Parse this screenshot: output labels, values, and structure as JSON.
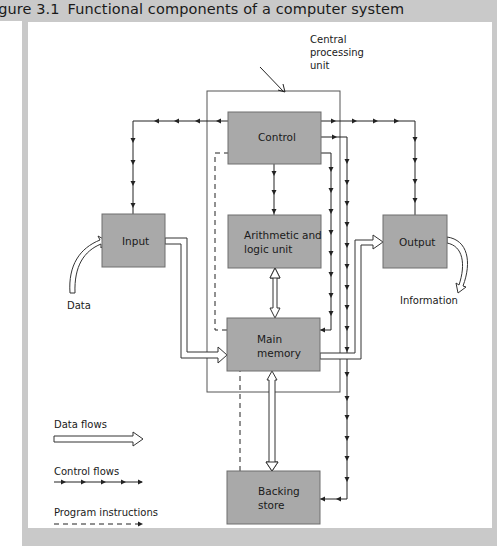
{
  "figure": {
    "number": "igure 3.1",
    "title": "Functional components of a computer system"
  },
  "diagram": {
    "cpu_label": [
      "Central",
      "processing",
      "unit"
    ],
    "nodes": {
      "control": {
        "label": [
          "Control"
        ]
      },
      "alu": {
        "label": [
          "Arithmetic and",
          "logic unit"
        ]
      },
      "input": {
        "label": [
          "Input"
        ]
      },
      "output": {
        "label": [
          "Output"
        ]
      },
      "main_memory": {
        "label": [
          "Main",
          "memory"
        ]
      },
      "backing_store": {
        "label": [
          "Backing",
          "store"
        ]
      }
    },
    "external": {
      "data_in": "Data",
      "info_out": "Information"
    },
    "edges": [
      {
        "from": "Data",
        "to": "Input",
        "type": "data"
      },
      {
        "from": "Input",
        "to": "Main memory",
        "type": "data"
      },
      {
        "from": "Main memory",
        "to": "Arithmetic and logic unit",
        "type": "data",
        "bidirectional": true
      },
      {
        "from": "Main memory",
        "to": "Output",
        "type": "data"
      },
      {
        "from": "Main memory",
        "to": "Backing store",
        "type": "data",
        "bidirectional": true
      },
      {
        "from": "Output",
        "to": "Information",
        "type": "data"
      },
      {
        "from": "Control",
        "to": "Input",
        "type": "control"
      },
      {
        "from": "Control",
        "to": "Arithmetic and logic unit",
        "type": "control"
      },
      {
        "from": "Control",
        "to": "Output",
        "type": "control"
      },
      {
        "from": "Control",
        "to": "Main memory",
        "type": "control"
      },
      {
        "from": "Control",
        "to": "Backing store",
        "type": "control"
      },
      {
        "from": "Main memory",
        "to": "Control",
        "type": "program"
      },
      {
        "from": "Backing store",
        "to": "Main memory",
        "type": "program"
      }
    ],
    "colors": {
      "box_fill": "#a9a9a9",
      "box_stroke": "#6e6e6e",
      "line": "#2a2a2a",
      "page_bg": "#c9c9c9",
      "panel_bg": "#ffffff"
    }
  },
  "legend": {
    "data_flows": "Data flows",
    "control_flows": "Control flows",
    "program_instructions": "Program instructions"
  }
}
